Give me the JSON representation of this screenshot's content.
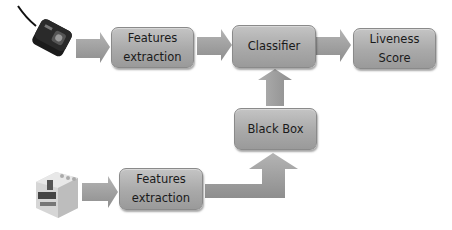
{
  "diagram": {
    "title": "",
    "nodes": {
      "features_top": {
        "label": "Features\nextraction"
      },
      "classifier": {
        "label": "Classifier"
      },
      "liveness": {
        "label": "Liveness\nScore"
      },
      "black_box": {
        "label": "Black Box"
      },
      "features_bottom": {
        "label": "Features\nextraction"
      }
    },
    "devices": {
      "top": "fingerprint-scanner-optical",
      "bottom": "fingerprint-scanner-capacitive"
    },
    "edges": [
      {
        "from": "device_top",
        "to": "features_top"
      },
      {
        "from": "features_top",
        "to": "classifier"
      },
      {
        "from": "classifier",
        "to": "liveness"
      },
      {
        "from": "black_box",
        "to": "classifier"
      },
      {
        "from": "device_bottom",
        "to": "features_bottom"
      },
      {
        "from": "features_bottom",
        "to": "black_box"
      }
    ],
    "colors": {
      "box_fill": "#aaaaaa",
      "arrow_fill": "#9e9e9e",
      "text": "#1a1a1a"
    }
  }
}
